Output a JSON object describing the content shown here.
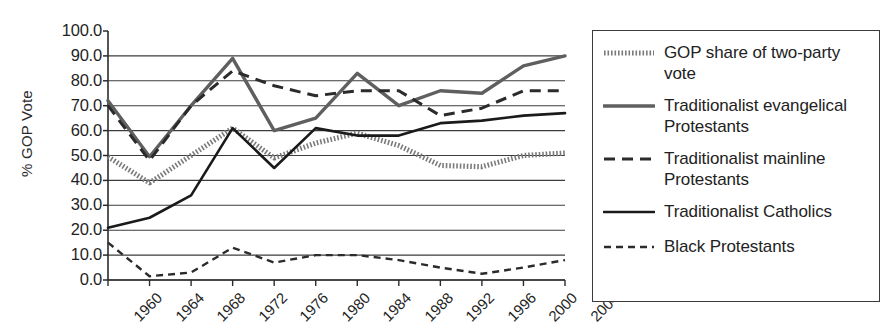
{
  "chart_data": {
    "type": "line",
    "title": "",
    "xlabel": "",
    "ylabel": "% GOP Vote",
    "ylim": [
      0,
      100
    ],
    "ytick_step": 10,
    "grid": true,
    "legend_position": "right",
    "categories": [
      "1960",
      "1964",
      "1968",
      "1972",
      "1976",
      "1980",
      "1984",
      "1988",
      "1992",
      "1996",
      "2000",
      "2004"
    ],
    "yticks": [
      "100.0",
      "90.0",
      "80.0",
      "70.0",
      "60.0",
      "50.0",
      "40.0",
      "30.0",
      "20.0",
      "10.0",
      "0.0"
    ],
    "series": [
      {
        "name": "GOP share of two-party vote",
        "style": "dotted",
        "color": "#7a7a7a",
        "values": [
          49.5,
          39.0,
          50.0,
          61.0,
          49.0,
          55.0,
          59.0,
          54.0,
          46.0,
          45.5,
          50.0,
          51.0
        ]
      },
      {
        "name": "Traditionalist evangelical Protestants",
        "style": "solid-thick-gray",
        "color": "#5f5f5f",
        "values": [
          72.0,
          49.5,
          70.0,
          89.0,
          60.0,
          65.0,
          83.0,
          70.0,
          76.0,
          75.0,
          86.0,
          90.0
        ]
      },
      {
        "name": "Traditionalist mainline Protestants",
        "style": "dashed-long",
        "color": "#2b2b2b",
        "values": [
          70.0,
          48.0,
          70.0,
          84.0,
          78.0,
          74.0,
          76.0,
          76.0,
          66.0,
          69.0,
          76.0,
          76.0
        ]
      },
      {
        "name": "Traditionalist Catholics",
        "style": "solid-thin-black",
        "color": "#1a1a1a",
        "values": [
          21.0,
          25.0,
          34.0,
          61.0,
          45.0,
          61.0,
          58.0,
          58.0,
          63.0,
          64.0,
          66.0,
          67.0
        ]
      },
      {
        "name": "Black Protestants",
        "style": "dashed-short",
        "color": "#2b2b2b",
        "values": [
          15.0,
          1.5,
          3.0,
          13.0,
          7.0,
          10.0,
          10.0,
          8.0,
          5.0,
          2.5,
          5.0,
          8.0
        ]
      }
    ]
  },
  "legend": {
    "items": [
      {
        "label": "GOP share of two-party vote"
      },
      {
        "label": "Traditionalist evangelical Protestants"
      },
      {
        "label": "Traditionalist mainline Protestants"
      },
      {
        "label": "Traditionalist Catholics"
      },
      {
        "label": "Black Protestants"
      }
    ]
  }
}
